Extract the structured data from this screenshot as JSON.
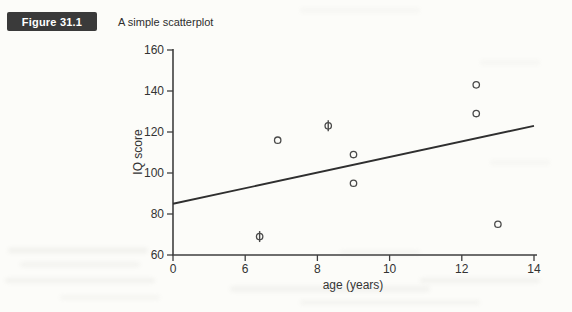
{
  "header": {
    "figure_label": "Figure 31.1",
    "caption": "A simple scatterplot"
  },
  "chart_data": {
    "type": "scatter",
    "title": "",
    "xlabel": "age (years)",
    "ylabel": "IQ score",
    "x_ticks": [
      0,
      6,
      8,
      10,
      12,
      14
    ],
    "x_ticks_equally_spaced": true,
    "y_ticks": [
      60,
      80,
      100,
      120,
      140,
      160
    ],
    "ylim": [
      60,
      160
    ],
    "grid": false,
    "legend": "none",
    "points": [
      {
        "x": 6.4,
        "y": 69,
        "marker": "circle-vline"
      },
      {
        "x": 6.9,
        "y": 116,
        "marker": "circle"
      },
      {
        "x": 8.3,
        "y": 123,
        "marker": "circle-vline"
      },
      {
        "x": 9.0,
        "y": 109,
        "marker": "circle"
      },
      {
        "x": 9.0,
        "y": 95,
        "marker": "circle"
      },
      {
        "x": 12.4,
        "y": 143,
        "marker": "circle"
      },
      {
        "x": 12.4,
        "y": 129,
        "marker": "circle"
      },
      {
        "x": 13.0,
        "y": 75,
        "marker": "circle"
      }
    ],
    "regression_line": {
      "x0": 0,
      "y0": 85,
      "x1": 14,
      "y1": 123
    },
    "colors": {
      "axis": "#3f3f3f",
      "marker": "#4a4a4a",
      "line": "#2f2f2f",
      "text": "#333333"
    }
  }
}
